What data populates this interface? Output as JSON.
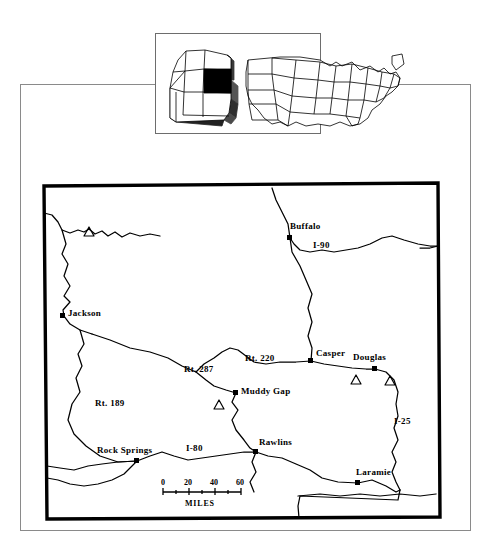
{
  "document": {
    "type": "map-figure",
    "subject": "Wyoming",
    "background_color": "#ffffff",
    "ink_color": "#000000"
  },
  "page_frame": {
    "name": "outer-page-border",
    "x": 20,
    "y": 84,
    "width": 450,
    "height": 446,
    "stroke": "#808080",
    "stroke_width": 1
  },
  "inset": {
    "name": "usa-locator-inset",
    "box": {
      "x": 155,
      "y": 33,
      "width": 165,
      "height": 100
    },
    "stroke": "#666666",
    "highlight_state": "Wyoming",
    "highlight_color": "#000000"
  },
  "state_outline": {
    "name": "wyoming-state-border",
    "x": 42,
    "y": 183,
    "width": 398,
    "height": 335,
    "stroke": "#000000",
    "stroke_width": 3.2
  },
  "cities": [
    {
      "name": "Buffalo",
      "label": "Buffalo",
      "marker_x": 290,
      "marker_y": 238,
      "label_x": 290,
      "label_y": 226,
      "anchor": "start"
    },
    {
      "name": "Casper",
      "label": "Casper",
      "marker_x": 311,
      "marker_y": 361,
      "label_x": 316,
      "label_y": 353,
      "anchor": "start"
    },
    {
      "name": "Douglas",
      "label": "Douglas",
      "marker_x": 375,
      "marker_y": 369,
      "label_x": 353,
      "label_y": 357,
      "anchor": "start"
    },
    {
      "name": "Jackson",
      "label": "Jackson",
      "marker_x": 63,
      "marker_y": 316,
      "label_x": 68,
      "label_y": 311,
      "anchor": "start"
    },
    {
      "name": "Muddy Gap",
      "label": "Muddy Gap",
      "marker_x": 236,
      "marker_y": 393,
      "label_x": 241,
      "label_y": 389,
      "anchor": "start"
    },
    {
      "name": "Rawlins",
      "label": "Rawlins",
      "marker_x": 256,
      "marker_y": 452,
      "label_x": 259,
      "label_y": 442,
      "anchor": "start"
    },
    {
      "name": "Rock Springs",
      "label": "Rock Springs",
      "marker_x": 137,
      "marker_y": 461,
      "label_x": 98,
      "label_y": 450,
      "anchor": "start"
    },
    {
      "name": "Laramie",
      "label": "Laramie",
      "marker_x": 358,
      "marker_y": 483,
      "label_x": 356,
      "label_y": 472,
      "anchor": "start"
    }
  ],
  "routes": [
    {
      "name": "I-90",
      "label": "I-90",
      "label_x": 313,
      "label_y": 245
    },
    {
      "name": "I-80",
      "label": "I-80",
      "label_x": 186,
      "label_y": 450
    },
    {
      "name": "I-25",
      "label": "I-25",
      "label_x": 394,
      "label_y": 421
    },
    {
      "name": "Rt. 287",
      "label": "Rt. 287",
      "label_x": 184,
      "label_y": 370
    },
    {
      "name": "Rt. 220",
      "label": "Rt. 220",
      "label_x": 245,
      "label_y": 359
    },
    {
      "name": "Rt. 189",
      "label": "Rt. 189",
      "label_x": 95,
      "label_y": 404
    }
  ],
  "site_markers": [
    {
      "name": "site-marker-northwest",
      "x": 89,
      "y": 233
    },
    {
      "name": "site-marker-central",
      "x": 219,
      "y": 406
    },
    {
      "name": "site-marker-douglas-w",
      "x": 356,
      "y": 381
    },
    {
      "name": "site-marker-douglas-e",
      "x": 390,
      "y": 382
    }
  ],
  "scale_bar": {
    "name": "scale-bar",
    "unit_label": "MILES",
    "tick_labels": [
      "0",
      "20",
      "40",
      "60"
    ],
    "tick_values": [
      0,
      20,
      40,
      60
    ],
    "bar_x": 163,
    "bar_y": 490,
    "bar_length": 78,
    "label_y": 484,
    "unit_y": 500
  }
}
